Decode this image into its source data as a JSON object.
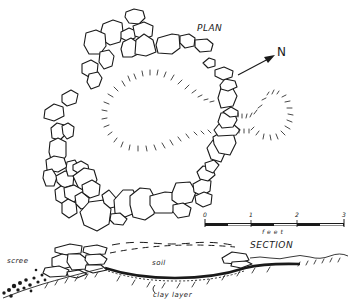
{
  "figure": {
    "type": "archaeological plan and section drawing",
    "plan": {
      "title": "PLAN",
      "north_arrow": {
        "label": "N",
        "icon": "north-arrow-icon"
      }
    },
    "scale_bar": {
      "ticks": [
        "0",
        "1",
        "2",
        "3"
      ],
      "unit_label": "feet"
    },
    "section": {
      "title": "SECTION",
      "labels": {
        "scree": "scree",
        "soil": "soil",
        "clay_layer": "clay layer"
      }
    }
  }
}
